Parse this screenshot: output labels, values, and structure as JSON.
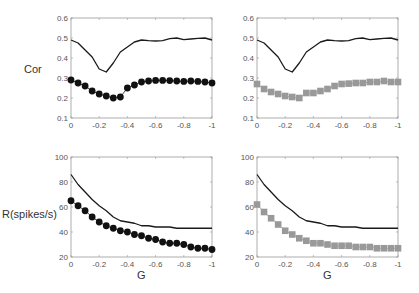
{
  "figure": {
    "ylabel_top": "Cor",
    "ylabel_bottom": "R(spikes/s)",
    "xlabel": "G"
  },
  "colors": {
    "line": "#1a1a1a",
    "dots": "#111111",
    "squares": "#999999",
    "axis": "#999999",
    "tick_text": "#555555"
  },
  "chart_data": [
    {
      "type": "line",
      "panel": "top-left",
      "title": "",
      "xlabel": "",
      "ylabel": "Cor",
      "xlim": [
        0,
        -1
      ],
      "ylim": [
        0.1,
        0.6
      ],
      "xticks": [
        "0",
        "-0.2",
        "-0.4",
        "-0.6",
        "-0.8",
        "-1"
      ],
      "yticks": [
        "0.1",
        "0.2",
        "0.3",
        "0.4",
        "0.5",
        "0.6"
      ],
      "grid": false,
      "x": [
        0,
        -0.05,
        -0.1,
        -0.15,
        -0.2,
        -0.25,
        -0.3,
        -0.35,
        -0.4,
        -0.45,
        -0.5,
        -0.55,
        -0.6,
        -0.65,
        -0.7,
        -0.75,
        -0.8,
        -0.85,
        -0.9,
        -0.95,
        -1
      ],
      "series": [
        {
          "name": "line",
          "style": "solid-line",
          "values": [
            0.49,
            0.475,
            0.44,
            0.405,
            0.345,
            0.33,
            0.375,
            0.43,
            0.455,
            0.48,
            0.49,
            0.487,
            0.485,
            0.487,
            0.497,
            0.5,
            0.492,
            0.495,
            0.498,
            0.5,
            0.49
          ]
        },
        {
          "name": "black-circles",
          "style": "black-circle-markers",
          "values": [
            0.29,
            0.275,
            0.26,
            0.235,
            0.22,
            0.21,
            0.2,
            0.205,
            0.25,
            0.265,
            0.28,
            0.285,
            0.288,
            0.288,
            0.287,
            0.285,
            0.283,
            0.285,
            0.283,
            0.28,
            0.275
          ]
        }
      ]
    },
    {
      "type": "line",
      "panel": "top-right",
      "title": "",
      "xlabel": "",
      "ylabel": "",
      "xlim": [
        0,
        -1
      ],
      "ylim": [
        0.1,
        0.6
      ],
      "xticks": [
        "0",
        "-0.2",
        "-0.4",
        "-0.6",
        "-0.8",
        "-1"
      ],
      "yticks": [
        "0.1",
        "0.2",
        "0.3",
        "0.4",
        "0.5",
        "0.6"
      ],
      "grid": false,
      "x": [
        0,
        -0.05,
        -0.1,
        -0.15,
        -0.2,
        -0.25,
        -0.3,
        -0.35,
        -0.4,
        -0.45,
        -0.5,
        -0.55,
        -0.6,
        -0.65,
        -0.7,
        -0.75,
        -0.8,
        -0.85,
        -0.9,
        -0.95,
        -1
      ],
      "series": [
        {
          "name": "line",
          "style": "solid-line",
          "values": [
            0.49,
            0.475,
            0.44,
            0.405,
            0.345,
            0.33,
            0.375,
            0.43,
            0.455,
            0.48,
            0.49,
            0.487,
            0.485,
            0.487,
            0.497,
            0.5,
            0.492,
            0.495,
            0.498,
            0.5,
            0.49
          ]
        },
        {
          "name": "gray-squares",
          "style": "gray-square-markers",
          "values": [
            0.27,
            0.245,
            0.23,
            0.22,
            0.21,
            0.205,
            0.2,
            0.225,
            0.225,
            0.235,
            0.245,
            0.26,
            0.27,
            0.272,
            0.275,
            0.275,
            0.28,
            0.28,
            0.285,
            0.28,
            0.28
          ]
        }
      ]
    },
    {
      "type": "line",
      "panel": "bottom-left",
      "title": "",
      "xlabel": "G",
      "ylabel": "R(spikes/s)",
      "xlim": [
        0,
        -1
      ],
      "ylim": [
        20,
        100
      ],
      "xticks": [
        "0",
        "-0.2",
        "-0.4",
        "-0.6",
        "-0.8",
        "-1"
      ],
      "yticks": [
        "20",
        "40",
        "60",
        "80",
        "100"
      ],
      "grid": false,
      "x": [
        0,
        -0.05,
        -0.1,
        -0.15,
        -0.2,
        -0.25,
        -0.3,
        -0.35,
        -0.4,
        -0.45,
        -0.5,
        -0.55,
        -0.6,
        -0.65,
        -0.7,
        -0.75,
        -0.8,
        -0.85,
        -0.9,
        -0.95,
        -1
      ],
      "series": [
        {
          "name": "line",
          "style": "solid-line",
          "values": [
            86,
            78,
            72,
            66,
            61,
            57,
            52,
            49,
            48,
            47,
            45,
            45,
            44,
            44,
            44,
            43,
            43,
            43,
            43,
            43,
            43
          ]
        },
        {
          "name": "black-circles",
          "style": "black-circle-markers",
          "values": [
            65,
            61,
            57,
            52,
            48,
            45,
            43,
            41,
            40,
            38,
            37,
            35,
            34,
            32,
            31,
            31,
            30,
            28,
            27,
            27,
            26
          ]
        }
      ]
    },
    {
      "type": "line",
      "panel": "bottom-right",
      "title": "",
      "xlabel": "G",
      "ylabel": "",
      "xlim": [
        0,
        -1
      ],
      "ylim": [
        20,
        100
      ],
      "xticks": [
        "0",
        "-0.2",
        "-0.4",
        "-0.6",
        "-0.8",
        "-1"
      ],
      "yticks": [
        "20",
        "40",
        "60",
        "80",
        "100"
      ],
      "grid": false,
      "x": [
        0,
        -0.05,
        -0.1,
        -0.15,
        -0.2,
        -0.25,
        -0.3,
        -0.35,
        -0.4,
        -0.45,
        -0.5,
        -0.55,
        -0.6,
        -0.65,
        -0.7,
        -0.75,
        -0.8,
        -0.85,
        -0.9,
        -0.95,
        -1
      ],
      "series": [
        {
          "name": "line",
          "style": "solid-line",
          "values": [
            86,
            78,
            72,
            66,
            61,
            57,
            52,
            49,
            48,
            47,
            45,
            45,
            44,
            44,
            44,
            43,
            43,
            43,
            43,
            43,
            43
          ]
        },
        {
          "name": "gray-squares",
          "style": "gray-square-markers",
          "values": [
            62,
            56,
            51,
            46,
            41,
            38,
            35,
            33,
            31,
            31,
            30,
            29,
            29,
            29,
            28,
            28,
            28,
            27,
            27,
            27,
            27
          ]
        }
      ]
    }
  ]
}
